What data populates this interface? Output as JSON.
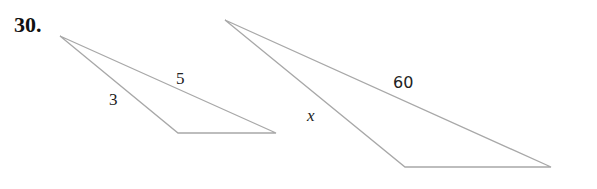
{
  "problem": {
    "number": "30."
  },
  "triangles": [
    {
      "name": "small-triangle",
      "sides": {
        "left": "3",
        "top": "5"
      }
    },
    {
      "name": "large-triangle",
      "sides": {
        "left": "x",
        "top": "60"
      }
    }
  ],
  "colors": {
    "line": "#a8a8a8",
    "text": "#222222"
  }
}
